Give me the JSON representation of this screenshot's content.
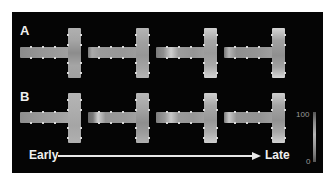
{
  "figure": {
    "rows": [
      {
        "label": "A",
        "shapes": [
          {
            "hbar_gradient": "linear-gradient(to right, #8a8a8a 0%, #959595 40%, #9a9a9a 70%, #a0a0a0 100%)",
            "vbar_gradient": "linear-gradient(to bottom, #b0b0b0 0%, #a5a5a5 25%, #8c8c8c 50%, #a5a5a5 75%, #a0a0a0 100%)"
          },
          {
            "hbar_gradient": "linear-gradient(to right, #7c7c7c 0%, #a9a9a9 8%, #9a9a9a 25%, #979797 70%, #9d9d9d 100%)",
            "vbar_gradient": "linear-gradient(to bottom, #b5b5b5 0%, #a0a0a0 30%, #969696 55%, #a4a4a4 80%, #b5b5b5 100%)"
          },
          {
            "hbar_gradient": "linear-gradient(to right, #7a7a7a 0%, #8f8f8f 15%, #cfcfcf 30%, #9c9c9c 45%, #959595 75%, #a0a0a0 100%)",
            "vbar_gradient": "linear-gradient(to bottom, #d0d0d0 0%, #a8a8a8 25%, #9a9a9a 50%, #a8a8a8 75%, #d5d5d5 100%)"
          },
          {
            "hbar_gradient": "linear-gradient(to right, #787878 0%, #b5b5b5 10%, #8e8e8e 25%, #959595 70%, #a0a0a0 100%)",
            "vbar_gradient": "linear-gradient(to bottom, #d5d5d5 0%, #a0a0a0 25%, #8f8f8f 55%, #a2a2a2 78%, #d8d8d8 100%)"
          }
        ]
      },
      {
        "label": "B",
        "shapes": [
          {
            "hbar_gradient": "linear-gradient(to right, #8e8e8e 0%, #999999 40%, #a0a0a0 75%, #a8a8a8 100%)",
            "vbar_gradient": "linear-gradient(to bottom, #b5b5b5 0%, #adadad 35%, #a5a5a5 65%, #b0b0b0 100%)"
          },
          {
            "hbar_gradient": "linear-gradient(to right, #6a6a6a 0%, #7a7a7a 10%, #cfcfcf 20%, #959595 35%, #999999 75%, #a2a2a2 100%)",
            "vbar_gradient": "linear-gradient(to bottom, #b8b8b8 0%, #a5a5a5 30%, #8e8e8e 60%, #9c9c9c 80%, #b0b0b0 100%)"
          },
          {
            "hbar_gradient": "linear-gradient(to right, #7e7e7e 0%, #9a9a9a 18%, #c8c8c8 30%, #9a9a9a 45%, #969696 75%, #a2a2a2 100%)",
            "vbar_gradient": "linear-gradient(to bottom, #d0d0d0 0%, #a8a8a8 25%, #979797 55%, #acacac 78%, #cfcfcf 100%)"
          },
          {
            "hbar_gradient": "linear-gradient(to right, #7c7c7c 0%, #c8c8c8 10%, #959595 25%, #939393 70%, #a0a0a0 100%)",
            "vbar_gradient": "linear-gradient(to bottom, #cfcfcf 0%, #a4a4a4 25%, #929292 55%, #a8a8a8 78%, #d2d2d2 100%)"
          }
        ]
      }
    ],
    "timeline": {
      "start_label": "Early",
      "end_label": "Late"
    },
    "colorbar": {
      "max_label": "100",
      "min_label": "0"
    }
  }
}
